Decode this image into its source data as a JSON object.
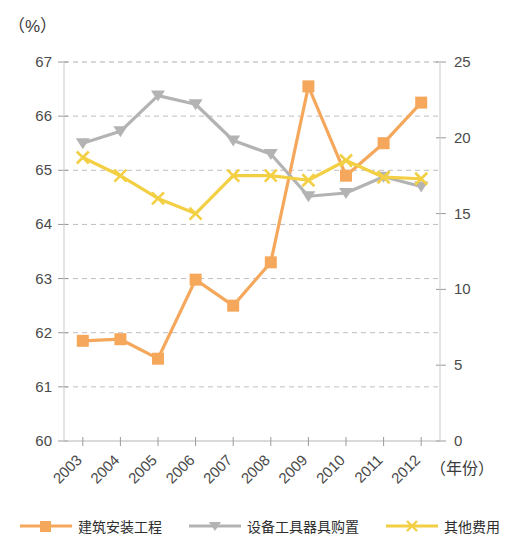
{
  "chart_data": {
    "type": "line",
    "title": "",
    "subtitle": "",
    "unit_label": "（%）",
    "xlabel": "（年份）",
    "ylabel": "",
    "categories": [
      "2003",
      "2004",
      "2005",
      "2006",
      "2007",
      "2008",
      "2009",
      "2010",
      "2011",
      "2012"
    ],
    "grid": true,
    "legend_position": "bottom",
    "axes": {
      "left": {
        "min": 60,
        "max": 67,
        "step": 1,
        "ticks": [
          "60",
          "61",
          "62",
          "63",
          "64",
          "65",
          "66",
          "67"
        ]
      },
      "right": {
        "min": 0,
        "max": 25,
        "step": 5,
        "ticks": [
          "0",
          "5",
          "10",
          "15",
          "20",
          "25"
        ]
      }
    },
    "series": [
      {
        "name": "建筑安装工程",
        "axis": "left",
        "color": "#F5A85C",
        "marker": "square",
        "values": [
          61.85,
          61.88,
          61.52,
          62.98,
          62.5,
          63.3,
          66.55,
          64.9,
          65.5,
          66.25
        ]
      },
      {
        "name": "设备工具器具购置",
        "axis": "left",
        "color": "#B3B3B3",
        "marker": "triangle",
        "values": [
          65.5,
          65.72,
          66.38,
          66.22,
          65.55,
          65.3,
          64.52,
          64.58,
          64.88,
          64.7
        ]
      },
      {
        "name": "其他费用",
        "axis": "right",
        "color": "#F3CF44",
        "marker": "cross",
        "values": [
          18.7,
          17.5,
          16.0,
          15.0,
          17.5,
          17.5,
          17.2,
          18.5,
          17.4,
          17.3
        ]
      }
    ]
  },
  "legend": {
    "items": [
      {
        "label": "建筑安装工程"
      },
      {
        "label": "设备工具器具购置"
      },
      {
        "label": "其他费用"
      }
    ]
  }
}
